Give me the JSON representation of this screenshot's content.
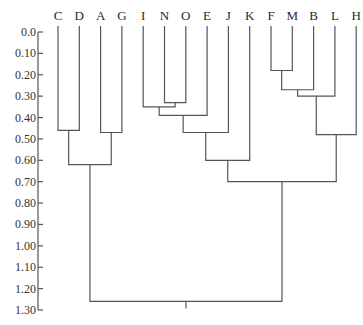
{
  "chart_data": {
    "type": "dendrogram",
    "title": "",
    "xlabel": "",
    "ylabel": "",
    "ylim": [
      0.0,
      1.3
    ],
    "y_ticks": [
      "0.0",
      "0.10",
      "0.20",
      "0.30",
      "0.40",
      "0.50",
      "0.60",
      "0.70",
      "0.80",
      "0.90",
      "1.00",
      "1.10",
      "1.20",
      "1.30"
    ],
    "leaves": [
      "C",
      "D",
      "A",
      "G",
      "I",
      "N",
      "O",
      "E",
      "J",
      "K",
      "F",
      "M",
      "B",
      "L",
      "H"
    ],
    "merges": [
      {
        "left": "C",
        "right": "D",
        "height": 0.46
      },
      {
        "left": "A",
        "right": "G",
        "height": 0.47
      },
      {
        "left": "CD",
        "right": "AG",
        "height": 0.62
      },
      {
        "left": "N",
        "right": "O",
        "height": 0.33
      },
      {
        "left": "I",
        "right": "NO",
        "height": 0.35
      },
      {
        "left": "INO",
        "right": "E",
        "height": 0.39
      },
      {
        "left": "INOE",
        "right": "J",
        "height": 0.47
      },
      {
        "left": "INOEJ",
        "right": "K",
        "height": 0.6
      },
      {
        "left": "F",
        "right": "M",
        "height": 0.18
      },
      {
        "left": "FM",
        "right": "B",
        "height": 0.27
      },
      {
        "left": "FMB",
        "right": "L",
        "height": 0.3
      },
      {
        "left": "FMBL",
        "right": "H",
        "height": 0.48
      },
      {
        "left": "INOEJK",
        "right": "FMBLH",
        "height": 0.7
      },
      {
        "left": "CDAG",
        "right": "INOEJKFMBLH",
        "height": 1.26
      }
    ],
    "grid": false,
    "legend": null
  }
}
